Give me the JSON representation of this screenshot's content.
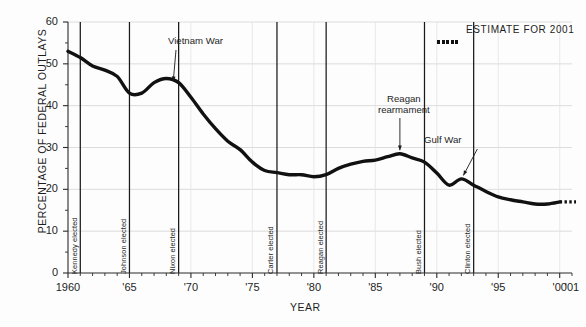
{
  "chart_data": {
    "type": "line",
    "title": "",
    "xlabel": "YEAR",
    "ylabel": "PERCENTAGE OF FEDERAL OUTLAYS",
    "xlim": [
      1960,
      2001
    ],
    "ylim": [
      0,
      60
    ],
    "yticks": [
      0,
      10,
      20,
      30,
      40,
      50,
      60
    ],
    "ytick_labels": [
      "0",
      "10",
      "20",
      "30",
      "40",
      "50",
      "60"
    ],
    "xtick_labels": [
      "1960",
      "'65",
      "'70",
      "'75",
      "'80",
      "'85",
      "'90",
      "'95",
      "'00",
      "'01"
    ],
    "xtick_values": [
      1960,
      1965,
      1970,
      1975,
      1980,
      1985,
      1990,
      1995,
      2000,
      2001
    ],
    "grid": "horizontal",
    "legend_position": "top-right",
    "series": [
      {
        "name": "Defense share of federal outlays",
        "x": [
          1960,
          1961,
          1962,
          1963,
          1964,
          1965,
          1966,
          1967,
          1968,
          1969,
          1970,
          1971,
          1972,
          1973,
          1974,
          1975,
          1976,
          1977,
          1978,
          1979,
          1980,
          1981,
          1982,
          1983,
          1984,
          1985,
          1986,
          1987,
          1988,
          1989,
          1990,
          1991,
          1992,
          1993,
          1994,
          1995,
          1996,
          1997,
          1998,
          1999,
          2000
        ],
        "y": [
          53.0,
          51.5,
          49.5,
          48.5,
          47.0,
          43.0,
          43.0,
          45.5,
          46.5,
          45.5,
          42.0,
          38.0,
          34.5,
          31.5,
          29.5,
          26.5,
          24.5,
          24.0,
          23.5,
          23.5,
          23.0,
          23.5,
          25.0,
          26.0,
          26.7,
          27.0,
          27.8,
          28.5,
          27.5,
          26.5,
          23.9,
          21.0,
          22.5,
          21.0,
          19.5,
          18.2,
          17.5,
          17.0,
          16.5,
          16.5,
          17.0
        ]
      }
    ],
    "estimate_point": {
      "x": 2001,
      "y": 17.0
    },
    "legend": {
      "label": "ESTIMATE FOR 2001",
      "marker": "dotted-line"
    },
    "annotations": [
      {
        "text": "Vietnam War",
        "target_x": 1968.4,
        "target_y": 46.3
      },
      {
        "text": "Reagan\nrearmament",
        "line1": "Reagan",
        "line2": "rearmament",
        "target_x": 1987.0,
        "target_y": 28.6
      },
      {
        "text": "Gulf War",
        "target_x": 1992.0,
        "target_y": 22.6
      }
    ],
    "event_lines": [
      {
        "label": "Kennedy elected",
        "year": 1961
      },
      {
        "label": "Johnson elected",
        "year": 1965
      },
      {
        "label": "Nixon elected",
        "year": 1969
      },
      {
        "label": "Carter elected",
        "year": 1977
      },
      {
        "label": "Reagan elected",
        "year": 1981
      },
      {
        "label": "Bush elected",
        "year": 1989
      },
      {
        "label": "Clinton elected",
        "year": 1993
      }
    ],
    "colors": {
      "line": "#111111",
      "axis": "#2a2a2a",
      "grid": "#d8d8d8",
      "event_line": "#1a1a1a"
    }
  }
}
